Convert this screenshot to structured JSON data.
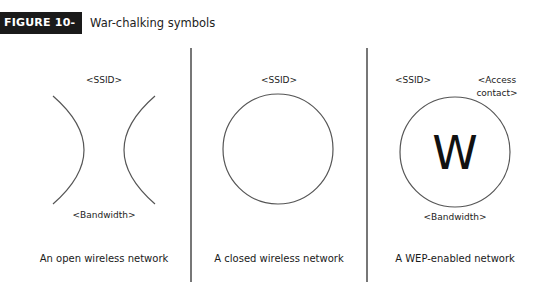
{
  "figure": {
    "label": "FIGURE 10-7",
    "title": "War-chalking symbols"
  },
  "panels": [
    {
      "id": "open",
      "top_label": "<SSID>",
      "bottom_label": "<Bandwidth>",
      "caption": "An open wireless network",
      "symbol": "back-to-back-arcs"
    },
    {
      "id": "closed",
      "top_label": "<SSID>",
      "caption": "A closed wireless network",
      "symbol": "circle"
    },
    {
      "id": "wep",
      "top_label": "<SSID>",
      "top_right_label_line1": "<Access",
      "top_right_label_line2": "contact>",
      "center_mark": "W",
      "bottom_label": "<Bandwidth>",
      "caption": "A WEP-enabled network",
      "symbol": "circle-with-w"
    }
  ],
  "colors": {
    "header_bg": "#1a1a1a",
    "header_text": "#ffffff",
    "stroke": "#555555",
    "divider": "#777777"
  }
}
